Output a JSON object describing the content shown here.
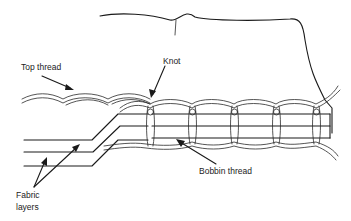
{
  "diagram": {
    "labels": {
      "top_thread": "Top thread",
      "knot": "Knot",
      "bobbin_thread": "Bobbin thread",
      "fabric_layers_line1": "Fabric",
      "fabric_layers_line2": "layers"
    },
    "colors": {
      "line": "#1a1a1a",
      "text": "#222222",
      "background": "#ffffff"
    },
    "stitch_count": 5
  }
}
